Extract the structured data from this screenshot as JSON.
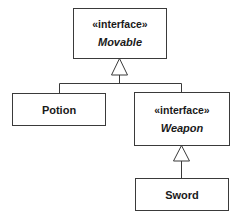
{
  "diagram": {
    "type": "uml-class",
    "nodes": [
      {
        "id": "movable",
        "stereotype": "«interface»",
        "name": "Movable",
        "kind": "interface"
      },
      {
        "id": "potion",
        "name": "Potion",
        "kind": "class"
      },
      {
        "id": "weapon",
        "stereotype": "«interface»",
        "name": "Weapon",
        "kind": "interface"
      },
      {
        "id": "sword",
        "name": "Sword",
        "kind": "class"
      }
    ],
    "edges": [
      {
        "from": "potion",
        "to": "movable",
        "type": "realization"
      },
      {
        "from": "weapon",
        "to": "movable",
        "type": "generalization"
      },
      {
        "from": "sword",
        "to": "weapon",
        "type": "realization"
      }
    ],
    "colors": {
      "line": "#3a3a3a",
      "background": "#ffffff",
      "text": "#1a1a1a"
    }
  }
}
